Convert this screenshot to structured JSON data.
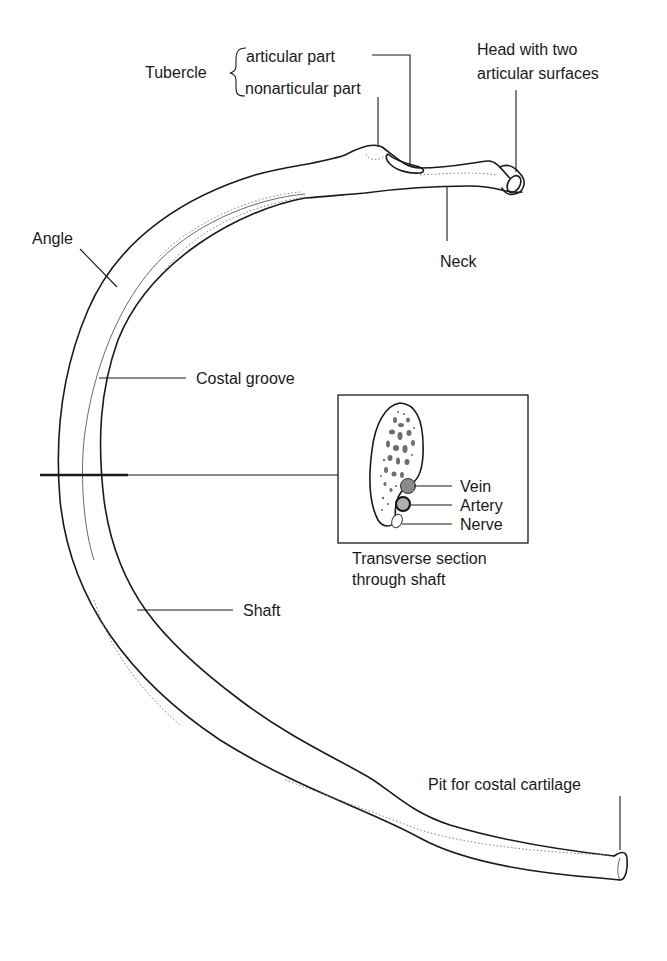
{
  "figure": {
    "type": "anatomical-diagram"
  },
  "labels": {
    "tubercle": "Tubercle",
    "tubercle_articular": "articular part",
    "tubercle_nonarticular": "nonarticular part",
    "head_line1": "Head with two",
    "head_line2": "articular surfaces",
    "neck": "Neck",
    "angle": "Angle",
    "costal_groove": "Costal groove",
    "shaft": "Shaft",
    "pit": "Pit for costal cartilage"
  },
  "inset": {
    "caption_line1": "Transverse section",
    "caption_line2": "through shaft",
    "vein": "Vein",
    "artery": "Artery",
    "nerve": "Nerve",
    "colors": {
      "vein_fill": "#8a8a8a",
      "artery_fill": "#b0b0b0",
      "marrow_fill": "#7a7a7a"
    }
  }
}
